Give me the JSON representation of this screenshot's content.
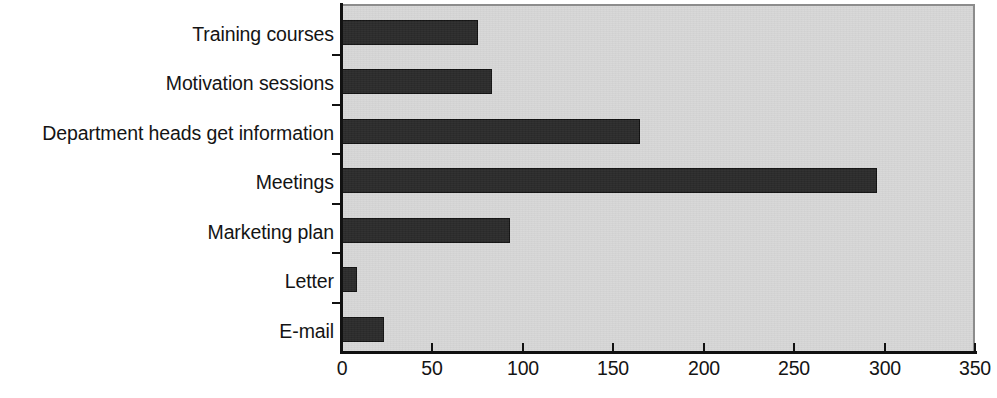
{
  "chart_data": {
    "type": "bar",
    "orientation": "horizontal",
    "title": "",
    "subtitle": "",
    "xlabel": "",
    "ylabel": "",
    "categories": [
      "Training courses",
      "Motivation sessions",
      "Department heads get information",
      "Meetings",
      "Marketing plan",
      "Letter",
      "E-mail"
    ],
    "values": [
      75,
      83,
      165,
      296,
      93,
      8,
      23
    ],
    "series": [
      {
        "name": "Responses",
        "values": [
          75,
          83,
          165,
          296,
          93,
          8,
          23
        ]
      }
    ],
    "xlim": [
      0,
      350
    ],
    "x_ticks": [
      0,
      50,
      100,
      150,
      200,
      250,
      300,
      350
    ],
    "x_tick_labels": [
      "0",
      "50",
      "100",
      "150",
      "200",
      "250",
      "300",
      "350"
    ],
    "grid": false,
    "legend": false,
    "legend_position": "none",
    "bar_color": "#2b2b2b",
    "plot_background_color": "#d7d7d7",
    "axis_color": "#111111",
    "text_color": "#141414"
  }
}
